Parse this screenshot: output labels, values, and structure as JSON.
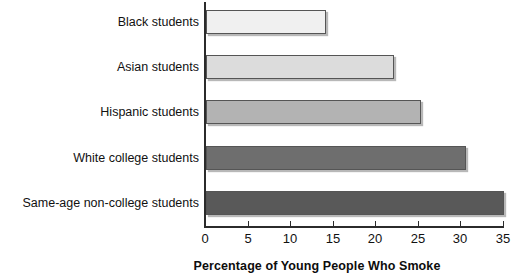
{
  "chart_data": {
    "type": "bar",
    "orientation": "horizontal",
    "title": "",
    "xlabel": "Percentage of Young People Who Smoke",
    "ylabel": "",
    "xlim": [
      0,
      35
    ],
    "xticks": [
      0,
      5,
      10,
      15,
      20,
      25,
      30,
      35
    ],
    "xtick_labels": [
      "0",
      "5",
      "10",
      "15",
      "20",
      "25",
      "30",
      "35"
    ],
    "grid": false,
    "legend": "none",
    "categories": [
      "Black students",
      "Asian students",
      "Hispanic students",
      "White college students",
      "Same-age non-college students"
    ],
    "values": [
      14.1,
      22.1,
      25.3,
      30.5,
      35.0
    ],
    "bar_colors": [
      "#f0f0f0",
      "#dcdcdc",
      "#b3b3b3",
      "#6e6e6e",
      "#595959"
    ],
    "bar_border_color": "#555555",
    "axis_color": "#2b2b2b"
  },
  "bars": [
    {
      "label": "Black students",
      "value": 14.1,
      "color": "#f0f0f0",
      "top": 10
    },
    {
      "label": "Asian students",
      "value": 22.1,
      "color": "#dcdcdc",
      "top": 55
    },
    {
      "label": "Hispanic students",
      "value": 25.3,
      "color": "#b3b3b3",
      "top": 100
    },
    {
      "label": "White college students",
      "value": 30.5,
      "color": "#6e6e6e",
      "top": 146
    },
    {
      "label": "Same-age non-college students",
      "value": 35.0,
      "color": "#595959",
      "top": 191
    }
  ],
  "ticks": [
    {
      "value": "0",
      "x": 205
    },
    {
      "value": "5",
      "x": 248
    },
    {
      "value": "10",
      "x": 290
    },
    {
      "value": "15",
      "x": 333
    },
    {
      "value": "20",
      "x": 375
    },
    {
      "value": "25",
      "x": 418
    },
    {
      "value": "30",
      "x": 460
    },
    {
      "value": "35",
      "x": 503
    }
  ],
  "axis": {
    "x_title": "Percentage of Young People Who Smoke"
  }
}
